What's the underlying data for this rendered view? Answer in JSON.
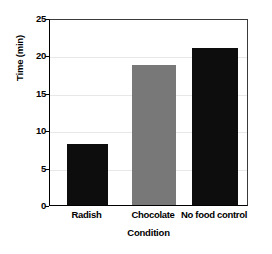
{
  "chart_data": {
    "type": "bar",
    "title": "",
    "subtitle": "",
    "xlabel": "Condition",
    "ylabel": "Time (min)",
    "categories": [
      "Radish",
      "Chocolate",
      "No food control"
    ],
    "values": [
      8.2,
      18.7,
      21.0
    ],
    "ylim": [
      0,
      25
    ],
    "yticks": [
      0,
      5,
      10,
      15,
      20,
      25
    ],
    "ytick_labels": [
      "0",
      "5",
      "10",
      "15",
      "20",
      "25"
    ],
    "grid": true,
    "grid_axis": "y",
    "legend": false,
    "legend_position": "none",
    "bar_colors": [
      "#0d0d0d",
      "#787878",
      "#0d0d0d"
    ],
    "frame_color": "#3a3a3a",
    "grid_color": "#e8e8e8",
    "background_color": "#ffffff",
    "annotations": []
  },
  "axes": {
    "y_title": "Time (min)",
    "x_title": "Condition"
  }
}
